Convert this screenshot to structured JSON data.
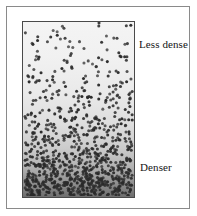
{
  "figure": {
    "labels": {
      "top": "Less dense",
      "bottom": "Denser"
    }
  },
  "chart_data": {
    "type": "scatter",
    "title": "",
    "subtitle": "",
    "xlabel": "",
    "ylabel": "",
    "grid": false,
    "legend_position": "right",
    "annotations": [
      {
        "text": "Less dense",
        "position": "right of box, upper area",
        "points_to": "top of box"
      },
      {
        "text": "Denser",
        "position": "right of box, lower area",
        "points_to": "bottom of box"
      }
    ],
    "box": {
      "x": 15,
      "y": 14,
      "width": 113,
      "height": 177
    },
    "marker": {
      "shape": "circle",
      "color": "#2b2b2b",
      "radius_px": 1.55
    },
    "background_gradient": {
      "top": "#f4f4f4",
      "bottom": "#6e6e6e"
    },
    "xlim": [
      0,
      1
    ],
    "ylim": [
      0,
      1
    ],
    "density_profile": {
      "xlabel": "relative depth from top (0 = top, 1 = bottom)",
      "ylabel": "dots per band",
      "bands": [
        {
          "depth_from": 0.0,
          "depth_to": 0.1,
          "count": 17
        },
        {
          "depth_from": 0.1,
          "depth_to": 0.2,
          "count": 22
        },
        {
          "depth_from": 0.2,
          "depth_to": 0.3,
          "count": 29
        },
        {
          "depth_from": 0.3,
          "depth_to": 0.4,
          "count": 39
        },
        {
          "depth_from": 0.4,
          "depth_to": 0.5,
          "count": 52
        },
        {
          "depth_from": 0.5,
          "depth_to": 0.6,
          "count": 70
        },
        {
          "depth_from": 0.6,
          "depth_to": 0.7,
          "count": 95
        },
        {
          "depth_from": 0.7,
          "depth_to": 0.8,
          "count": 130
        },
        {
          "depth_from": 0.8,
          "depth_to": 0.9,
          "count": 180
        },
        {
          "depth_from": 0.9,
          "depth_to": 1.0,
          "count": 250
        }
      ],
      "total_dots": 884
    }
  }
}
